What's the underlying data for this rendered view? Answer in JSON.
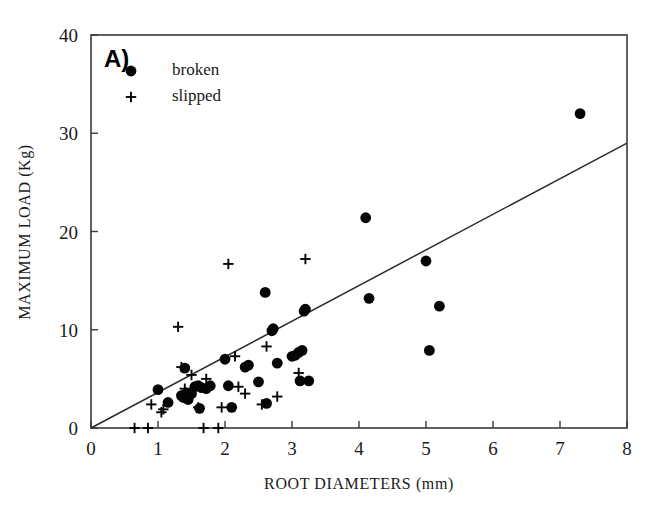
{
  "panel": {
    "label": "A)"
  },
  "legend": {
    "position": "top-left",
    "entries": [
      {
        "marker": "filled-circle",
        "label": "broken"
      },
      {
        "marker": "plus",
        "label": "slipped"
      }
    ]
  },
  "axes": {
    "x": {
      "title": "ROOT DIAMETERS (mm)",
      "ticks": [
        "0",
        "1",
        "2",
        "3",
        "4",
        "5",
        "6",
        "7",
        "8"
      ],
      "min": 0,
      "max": 8
    },
    "y": {
      "title": "MAXIMUM LOAD (Kg)",
      "ticks": [
        "0",
        "10",
        "20",
        "30",
        "40"
      ],
      "min": 0,
      "max": 40
    }
  },
  "colors": {
    "marker": "#050505",
    "axis": "#3a3a3a",
    "trend": "#2b2b2b",
    "background": "#ffffff"
  },
  "chart_data": {
    "type": "scatter",
    "title": "A)",
    "xlabel": "ROOT DIAMETERS (mm)",
    "ylabel": "MAXIMUM LOAD (Kg)",
    "xlim": [
      0,
      8
    ],
    "ylim": [
      0,
      40
    ],
    "xticks": [
      0,
      1,
      2,
      3,
      4,
      5,
      6,
      7,
      8
    ],
    "yticks": [
      0,
      10,
      20,
      30,
      40
    ],
    "grid": false,
    "legend_position": "top-left",
    "series": [
      {
        "name": "broken",
        "marker": "filled-circle",
        "points": [
          [
            1.0,
            3.9
          ],
          [
            1.15,
            2.6
          ],
          [
            1.35,
            3.3
          ],
          [
            1.38,
            3.1
          ],
          [
            1.4,
            6.1
          ],
          [
            1.42,
            3.5
          ],
          [
            1.45,
            2.9
          ],
          [
            1.5,
            3.5
          ],
          [
            1.55,
            4.2
          ],
          [
            1.6,
            4.3
          ],
          [
            1.62,
            2.0
          ],
          [
            1.65,
            4.1
          ],
          [
            1.72,
            4.0
          ],
          [
            1.78,
            4.3
          ],
          [
            2.0,
            7.0
          ],
          [
            2.05,
            4.3
          ],
          [
            2.1,
            2.1
          ],
          [
            2.3,
            6.2
          ],
          [
            2.35,
            6.4
          ],
          [
            2.5,
            4.7
          ],
          [
            2.6,
            13.8
          ],
          [
            2.62,
            2.5
          ],
          [
            2.7,
            9.9
          ],
          [
            2.72,
            10.1
          ],
          [
            2.78,
            6.6
          ],
          [
            3.0,
            7.3
          ],
          [
            3.05,
            7.4
          ],
          [
            3.1,
            7.7
          ],
          [
            3.12,
            4.8
          ],
          [
            3.15,
            7.9
          ],
          [
            3.18,
            11.9
          ],
          [
            3.2,
            12.1
          ],
          [
            3.25,
            4.8
          ],
          [
            4.1,
            21.4
          ],
          [
            4.15,
            13.2
          ],
          [
            5.0,
            17.0
          ],
          [
            5.05,
            7.9
          ],
          [
            5.2,
            12.4
          ],
          [
            7.3,
            32.0
          ]
        ]
      },
      {
        "name": "slipped",
        "marker": "plus",
        "points": [
          [
            0.65,
            0.0
          ],
          [
            0.85,
            0.0
          ],
          [
            0.9,
            2.4
          ],
          [
            1.05,
            1.6
          ],
          [
            1.08,
            1.9
          ],
          [
            1.3,
            10.3
          ],
          [
            1.35,
            6.2
          ],
          [
            1.4,
            4.0
          ],
          [
            1.42,
            3.6
          ],
          [
            1.48,
            3.2
          ],
          [
            1.5,
            5.4
          ],
          [
            1.6,
            2.1
          ],
          [
            1.68,
            0.0
          ],
          [
            1.72,
            5.0
          ],
          [
            1.9,
            0.0
          ],
          [
            1.95,
            2.1
          ],
          [
            2.05,
            16.7
          ],
          [
            2.15,
            7.3
          ],
          [
            2.2,
            4.2
          ],
          [
            2.3,
            3.5
          ],
          [
            2.55,
            2.4
          ],
          [
            2.62,
            8.3
          ],
          [
            2.78,
            3.2
          ],
          [
            3.1,
            5.6
          ],
          [
            3.2,
            17.2
          ]
        ]
      }
    ],
    "trend_line": {
      "from": [
        0,
        0
      ],
      "to": [
        8,
        29.0
      ]
    }
  }
}
